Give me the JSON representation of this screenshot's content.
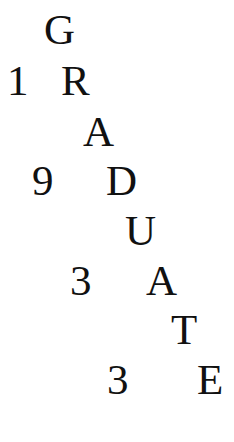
{
  "poster": {
    "word_letters": [
      "G",
      "R",
      "A",
      "D",
      "U",
      "A",
      "T",
      "E"
    ],
    "year_digits": [
      "1",
      "9",
      "3",
      "3"
    ],
    "word": "GRADUATE",
    "year": "1933",
    "text_color": "#111111",
    "background_color": "#ffffff"
  }
}
